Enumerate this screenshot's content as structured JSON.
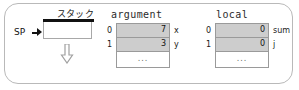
{
  "diagram": {
    "stack": {
      "title": "スタック",
      "pointer_label": "SP",
      "pointer_icon": "right-triangle-arrow-icon",
      "growth_icon": "down-arrow-icon"
    },
    "segments": [
      {
        "name": "argument",
        "title": "argument",
        "rows": [
          {
            "index": "0",
            "value": "7",
            "label": "x"
          },
          {
            "index": "1",
            "value": "3",
            "label": "y"
          }
        ],
        "ellipsis": "..."
      },
      {
        "name": "local",
        "title": "local",
        "rows": [
          {
            "index": "0",
            "value": "0",
            "label": "sum"
          },
          {
            "index": "1",
            "value": "0",
            "label": "j"
          }
        ],
        "ellipsis": "..."
      }
    ],
    "colors": {
      "frame_border": "#b9b9b9",
      "cell_fill": "#cdcdcd",
      "cell_border": "#9a9a9a",
      "stack_top_bar": "#111111",
      "background": "#ffffff"
    }
  }
}
